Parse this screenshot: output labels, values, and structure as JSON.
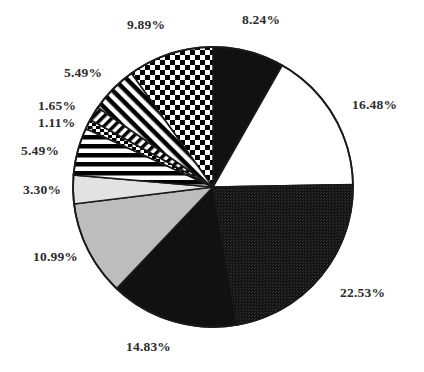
{
  "chart_data": {
    "type": "pie",
    "title": "",
    "subtitle": "",
    "xlabel": "",
    "ylabel": "",
    "legend_position": "none",
    "grid": false,
    "value_unit": "%",
    "total": 99.99,
    "start_angle_deg": 0,
    "direction": "clockwise",
    "center": {
      "x": 213,
      "y": 187
    },
    "radius": 140,
    "categories": [
      "Slice 1",
      "Slice 2",
      "Slice 3",
      "Slice 4",
      "Slice 5",
      "Slice 6",
      "Slice 7",
      "Slice 8",
      "Slice 9",
      "Slice 10",
      "Slice 11"
    ],
    "values": [
      8.24,
      16.48,
      22.53,
      14.83,
      10.99,
      3.3,
      5.49,
      1.11,
      1.65,
      5.49,
      9.89
    ],
    "labels": [
      "8.24%",
      "16.48%",
      "22.53%",
      "14.83%",
      "10.99%",
      "3.30%",
      "5.49%",
      "1.11%",
      "1.65%",
      "5.49%",
      "9.89%"
    ],
    "slices": [
      {
        "label": "8.24%",
        "value": 8.24,
        "fill": "solid-black",
        "color": "#111111",
        "label_x": 242,
        "label_y": 13,
        "label_align": "left"
      },
      {
        "label": "16.48%",
        "value": 16.48,
        "fill": "solid-white",
        "color": "#ffffff",
        "label_x": 352,
        "label_y": 98,
        "label_align": "left"
      },
      {
        "label": "22.53%",
        "value": 22.53,
        "fill": "dark-texture",
        "color": "#191919",
        "label_x": 340,
        "label_y": 286,
        "label_align": "left"
      },
      {
        "label": "14.83%",
        "value": 14.83,
        "fill": "solid-black",
        "color": "#111111",
        "label_x": 126,
        "label_y": 340,
        "label_align": "left"
      },
      {
        "label": "10.99%",
        "value": 10.99,
        "fill": "light-gray",
        "color": "#bdbdbd",
        "label_x": 33,
        "label_y": 250,
        "label_align": "left"
      },
      {
        "label": "3.30%",
        "value": 3.3,
        "fill": "very-light-gray",
        "color": "#e2e2e2",
        "label_x": 23,
        "label_y": 183,
        "label_align": "left"
      },
      {
        "label": "5.49%",
        "value": 5.49,
        "fill": "horizontal-lines",
        "color": "#000000",
        "label_x": 21,
        "label_y": 144,
        "label_align": "left"
      },
      {
        "label": "1.11%",
        "value": 1.11,
        "fill": "fine-dashes",
        "color": "#000000",
        "label_x": 38,
        "label_y": 116,
        "label_align": "left"
      },
      {
        "label": "1.65%",
        "value": 1.65,
        "fill": "diagonal-hatch",
        "color": "#000000",
        "label_x": 38,
        "label_y": 99,
        "label_align": "left"
      },
      {
        "label": "5.49%",
        "value": 5.49,
        "fill": "diagonal-hatch-2",
        "color": "#000000",
        "label_x": 64,
        "label_y": 66,
        "label_align": "left"
      },
      {
        "label": "9.89%",
        "value": 9.89,
        "fill": "checkerboard",
        "color": "#000000",
        "label_x": 127,
        "label_y": 18,
        "label_align": "left"
      }
    ]
  },
  "colors": {
    "background": "#ffffff",
    "outline": "#1a1a1a",
    "label_text": "#2b2b2b"
  }
}
